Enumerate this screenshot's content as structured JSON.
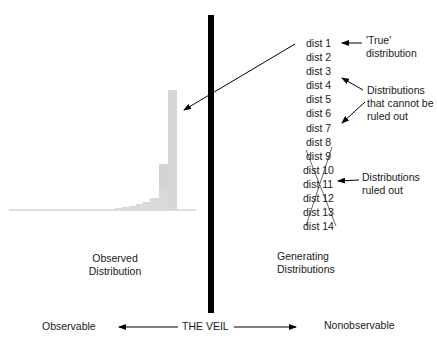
{
  "left": {
    "caption_line1": "Observed",
    "caption_line2": "Distribution",
    "bottom_label": "Observable"
  },
  "right": {
    "caption_line1": "Generating",
    "caption_line2": "Distributions",
    "bottom_label": "Nonobservable",
    "distributions": [
      "dist 1",
      "dist 2",
      "dist 3",
      "dist 4",
      "dist 5",
      "dist 6",
      "dist 7",
      "dist 8",
      "dist 9",
      "dist 10",
      "dist 11",
      "dist 12",
      "dist 13",
      "dist 14"
    ]
  },
  "annotations": {
    "true_line1": "'True'",
    "true_line2": "distribution",
    "notruled_line1": "Distributions",
    "notruled_line2": "that cannot be",
    "notruled_line3": "ruled out",
    "ruled_line1": "Distributions",
    "ruled_line2": "ruled out"
  },
  "veil": {
    "label": "THE VEIL"
  },
  "colors": {
    "veil": "#000000",
    "bars": "#d9d9d9",
    "baseline": "#bdbdbd",
    "text": "#1a1a1a"
  },
  "histogram": {
    "bar_heights_px": [
      1,
      1,
      2,
      3,
      4,
      6,
      9,
      14,
      22,
      36,
      120
    ]
  }
}
